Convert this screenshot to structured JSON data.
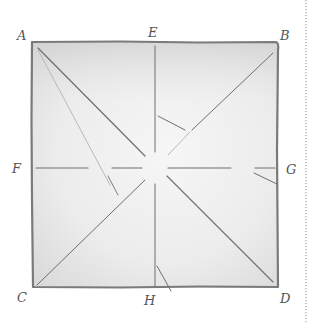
{
  "diagram": {
    "type": "geometric-folding-square",
    "labels": {
      "A": "A",
      "B": "B",
      "C": "C",
      "D": "D",
      "E": "E",
      "F": "F",
      "G": "G",
      "H": "H"
    },
    "corners": {
      "top_left": "A",
      "top_right": "B",
      "bottom_left": "C",
      "bottom_right": "D"
    },
    "midpoints": {
      "top": "E",
      "left": "F",
      "right": "G",
      "bottom": "H"
    },
    "lines": [
      {
        "from": "A",
        "to": "D",
        "kind": "diagonal"
      },
      {
        "from": "B",
        "to": "C",
        "kind": "diagonal"
      },
      {
        "from": "E",
        "to": "H",
        "kind": "vertical-crease"
      },
      {
        "from": "F",
        "to": "G",
        "kind": "horizontal-crease"
      },
      {
        "from": "A",
        "to": "near-center",
        "kind": "faint-fold"
      }
    ],
    "colors": {
      "paper_shade": "#e4e4e4",
      "pencil": "#6e6e6e",
      "background": "#ffffff"
    }
  }
}
